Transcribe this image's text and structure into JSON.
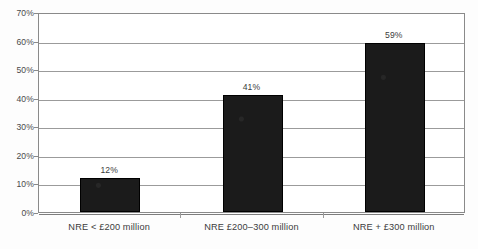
{
  "chart_data": {
    "type": "bar",
    "title": "",
    "xlabel": "",
    "ylabel": "",
    "categories": [
      "NRE < £200 million",
      "NRE £200–300 million",
      "NRE + £300 million"
    ],
    "values": [
      12,
      41,
      59
    ],
    "value_labels": [
      "12%",
      "41%",
      "59%"
    ],
    "ylim": [
      0,
      70
    ],
    "ytick_labels": [
      "0%",
      "10%",
      "20%",
      "30%",
      "40%",
      "50%",
      "60%",
      "70%"
    ],
    "ytick_values": [
      0,
      10,
      20,
      30,
      40,
      50,
      60,
      70
    ],
    "grid": true,
    "legend": null,
    "bar_color": "#1b1b1b",
    "gridline_color": "#9b9b9b",
    "axis_color": "#8a8a8a",
    "background_color": "#ffffff"
  }
}
